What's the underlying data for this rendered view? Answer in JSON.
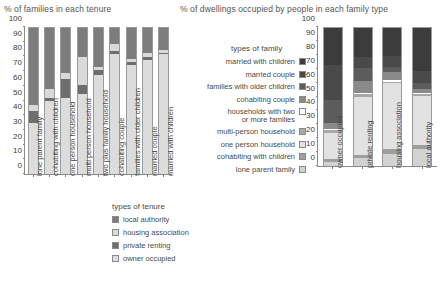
{
  "left_chart": {
    "title": "% of families in each tenure",
    "legend_title": "types of tenure"
  },
  "right_chart": {
    "title": "% of dwellings occupied by people in each family type",
    "legend_title": "types of family"
  },
  "colors": {
    "local_authority": "#7d7d7d",
    "housing_association": "#d9d9d9",
    "private_renting": "#6e6e6e",
    "owner_occupied": "#dcdcdc",
    "married_with_children": "#3c3c3c",
    "married_couple": "#4a4a4a",
    "families_with_older_children": "#5c5c5c",
    "cohabiting_couple": "#8a8a8a",
    "households_with_two_or_more_families": "#ffffff",
    "multi_person_household": "#a8a8a8",
    "one_person_household": "#e2e2e2",
    "cohabiting_with_children": "#9e9e9e",
    "lone_parent_family": "#d2d2d2",
    "axis": "#8a8a8a",
    "text": "#4a4a4a"
  },
  "chart_data": [
    {
      "type": "bar",
      "id": "families-in-each-tenure",
      "stacked": true,
      "percent": true,
      "title": "% of families in each tenure",
      "xlabel": "",
      "ylabel": "",
      "ylim": [
        0,
        100
      ],
      "yticks": [
        0,
        10,
        20,
        30,
        40,
        50,
        60,
        70,
        80,
        90,
        100
      ],
      "grid": false,
      "legend_title": "types of tenure",
      "legend_position": "bottom-right",
      "categories": [
        "lone parent family",
        "cohabiting with children",
        "one person household",
        "multi person household",
        "two plus family household",
        "cohabiting couple",
        "families with older children",
        "married couple",
        "married with children"
      ],
      "series": [
        {
          "name": "owner occupied",
          "values": [
            35,
            50,
            52,
            55,
            68,
            82,
            75,
            78,
            82
          ]
        },
        {
          "name": "private renting",
          "values": [
            8,
            2,
            13,
            6,
            3,
            2,
            2,
            2,
            1
          ]
        },
        {
          "name": "housing association",
          "values": [
            4,
            6,
            4,
            19,
            2,
            5,
            2,
            3,
            2
          ]
        },
        {
          "name": "local authority",
          "values": [
            53,
            42,
            31,
            20,
            27,
            11,
            21,
            17,
            15
          ]
        }
      ]
    },
    {
      "type": "bar",
      "id": "dwellings-by-family-type",
      "stacked": true,
      "percent": true,
      "title": "% of dwellings occupied by people in each family type",
      "xlabel": "",
      "ylabel": "",
      "ylim": [
        0,
        100
      ],
      "yticks": [
        0,
        10,
        20,
        30,
        40,
        50,
        60,
        70,
        80,
        90,
        100
      ],
      "grid": false,
      "legend_title": "types of family",
      "legend_position": "left",
      "categories": [
        "owner occupied",
        "private renting",
        "housing association",
        "local authority"
      ],
      "series": [
        {
          "name": "lone parent family",
          "values": [
            3,
            6,
            9,
            12
          ]
        },
        {
          "name": "cohabiting with children",
          "values": [
            2,
            2,
            3,
            3
          ]
        },
        {
          "name": "one person household",
          "values": [
            19,
            42,
            48,
            36
          ]
        },
        {
          "name": "multi-person household",
          "values": [
            2,
            2,
            1,
            1
          ]
        },
        {
          "name": "households with two or more families",
          "values": [
            1,
            1,
            1,
            1
          ]
        },
        {
          "name": "cohabiting couple",
          "values": [
            4,
            9,
            6,
            3
          ]
        },
        {
          "name": "families with older children",
          "values": [
            17,
            9,
            4,
            4
          ]
        },
        {
          "name": "married couple",
          "values": [
            25,
            8,
            8,
            9
          ]
        },
        {
          "name": "married with children",
          "values": [
            27,
            21,
            20,
            31
          ]
        }
      ]
    }
  ],
  "left_legend_items": [
    {
      "label": "local authority",
      "color_key": "local_authority"
    },
    {
      "label": "housing association",
      "color_key": "housing_association"
    },
    {
      "label": "private renting",
      "color_key": "private_renting"
    },
    {
      "label": "owner occupied",
      "color_key": "owner_occupied"
    }
  ],
  "right_legend_items": [
    {
      "label": "married with children",
      "color_key": "married_with_children"
    },
    {
      "label": "married couple",
      "color_key": "married_couple"
    },
    {
      "label": "families with older children",
      "color_key": "families_with_older_children"
    },
    {
      "label": "cohabiting couple",
      "color_key": "cohabiting_couple"
    },
    {
      "label": "households with two\nor more families",
      "color_key": "households_with_two_or_more_families"
    },
    {
      "label": "multi-person household",
      "color_key": "multi_person_household"
    },
    {
      "label": "one person household",
      "color_key": "one_person_household"
    },
    {
      "label": "cohabiting with children",
      "color_key": "cohabiting_with_children"
    },
    {
      "label": "lone parent family",
      "color_key": "lone_parent_family"
    }
  ]
}
